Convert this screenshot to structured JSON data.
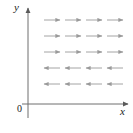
{
  "figure": {
    "type": "direction-field",
    "background_color": "#ffffff",
    "axis_color": "#6e6e6e",
    "arrow_color": "#9a9a9a",
    "label_color": "#1a1a1a"
  },
  "axes": {
    "x_label": "x",
    "y_label": "y",
    "origin_label": "0",
    "x_axis": {
      "y_px": 104,
      "x_start_px": 28,
      "x_end_px": 130,
      "arrowhead": "right"
    },
    "y_axis": {
      "x_px": 28,
      "y_start_px": 104,
      "y_end_px": 8,
      "arrowhead": "up"
    }
  },
  "chart_data": {
    "type": "scatter",
    "title": "",
    "xlabel": "x",
    "ylabel": "y",
    "grid": false,
    "legend": null,
    "columns_px": [
      52,
      73,
      94,
      115
    ],
    "rows_px": [
      20,
      36,
      52,
      68,
      84
    ],
    "arrow_length_px": 16,
    "rows": [
      {
        "row": 1,
        "y_px": 20,
        "direction": "right",
        "count": 4
      },
      {
        "row": 2,
        "y_px": 36,
        "direction": "right",
        "count": 4
      },
      {
        "row": 3,
        "y_px": 52,
        "direction": "right",
        "count": 4
      },
      {
        "row": 4,
        "y_px": 68,
        "direction": "left",
        "count": 4
      },
      {
        "row": 5,
        "y_px": 84,
        "direction": "left",
        "count": 4
      }
    ]
  }
}
